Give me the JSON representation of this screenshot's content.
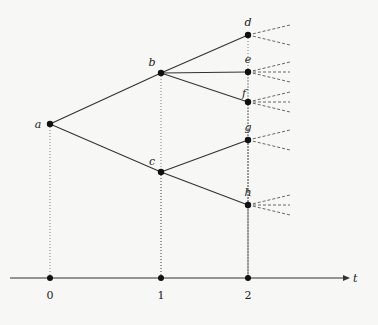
{
  "diagram": {
    "type": "event-tree",
    "nodes": [
      {
        "id": "a",
        "label": "a",
        "x": 50,
        "y": 124,
        "time": 0
      },
      {
        "id": "b",
        "label": "b",
        "x": 161,
        "y": 73,
        "time": 1
      },
      {
        "id": "c",
        "label": "c",
        "x": 161,
        "y": 172,
        "time": 1
      },
      {
        "id": "d",
        "label": "d",
        "x": 248,
        "y": 35,
        "time": 2
      },
      {
        "id": "e",
        "label": "e",
        "x": 248,
        "y": 72,
        "time": 2
      },
      {
        "id": "f",
        "label": "f",
        "x": 248,
        "y": 102,
        "time": 2
      },
      {
        "id": "g",
        "label": "g",
        "x": 248,
        "y": 140,
        "time": 2
      },
      {
        "id": "h",
        "label": "h",
        "x": 248,
        "y": 205,
        "time": 2
      }
    ],
    "edges": [
      [
        "a",
        "b"
      ],
      [
        "a",
        "c"
      ],
      [
        "b",
        "d"
      ],
      [
        "b",
        "e"
      ],
      [
        "b",
        "f"
      ],
      [
        "c",
        "g"
      ],
      [
        "c",
        "h"
      ]
    ],
    "future_branches": {
      "d": 2,
      "e": 3,
      "f": 3,
      "g": 2,
      "h": 3
    },
    "axis": {
      "label": "t",
      "y": 278,
      "ticks": [
        {
          "label": "0",
          "x": 50
        },
        {
          "label": "1",
          "x": 161
        },
        {
          "label": "2",
          "x": 248
        }
      ]
    }
  }
}
